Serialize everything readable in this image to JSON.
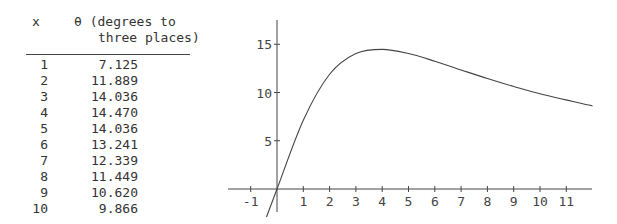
{
  "table": {
    "headers": {
      "x": "x",
      "theta_line1": "θ (degrees to",
      "theta_line2": "three places)"
    },
    "rows": [
      {
        "x": "1",
        "theta": "7.125"
      },
      {
        "x": "2",
        "theta": "11.889"
      },
      {
        "x": "3",
        "theta": "14.036"
      },
      {
        "x": "4",
        "theta": "14.470"
      },
      {
        "x": "5",
        "theta": "14.036"
      },
      {
        "x": "6",
        "theta": "13.241"
      },
      {
        "x": "7",
        "theta": "12.339"
      },
      {
        "x": "8",
        "theta": "11.449"
      },
      {
        "x": "9",
        "theta": "10.620"
      },
      {
        "x": "10",
        "theta": "9.866"
      }
    ]
  },
  "chart_data": {
    "type": "line",
    "title": "",
    "xlabel": "x",
    "ylabel": "θ (degrees)",
    "x": [
      0,
      1,
      2,
      3,
      4,
      5,
      6,
      7,
      8,
      9,
      10,
      12
    ],
    "values": [
      0,
      7.125,
      11.889,
      14.036,
      14.47,
      14.036,
      13.241,
      12.339,
      11.449,
      10.62,
      9.866,
      8.6
    ],
    "xlim": [
      -1.6,
      12
    ],
    "ylim": [
      -2,
      17
    ],
    "x_ticks": [
      "-1",
      "1",
      "2",
      "3",
      "4",
      "5",
      "6",
      "7",
      "8",
      "9",
      "10",
      "11"
    ],
    "y_ticks": [
      "5",
      "10",
      "15"
    ],
    "grid": false,
    "legend": null
  }
}
